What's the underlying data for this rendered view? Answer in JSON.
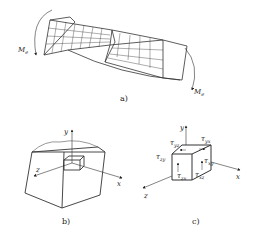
{
  "figure": {
    "panel_a": {
      "caption": "a)",
      "moment_left": {
        "symbol": "M",
        "subscript": "e"
      },
      "moment_right": {
        "symbol": "M",
        "subscript": "e"
      },
      "description": "Twisted rectangular bar with surface grid under torque"
    },
    "panel_b": {
      "caption": "b)",
      "axes": {
        "x": "x",
        "y": "y",
        "z": "z"
      },
      "description": "Cut-out block with small element at origin"
    },
    "panel_c": {
      "caption": "c)",
      "axes": {
        "x": "x",
        "y": "y",
        "z": "z"
      },
      "stresses": [
        {
          "symbol": "τ",
          "subscript": "yz"
        },
        {
          "symbol": "τ",
          "subscript": "yx"
        },
        {
          "symbol": "τ",
          "subscript": "zy"
        },
        {
          "symbol": "τ",
          "subscript": "xy"
        },
        {
          "symbol": "τ",
          "subscript": "zx"
        },
        {
          "symbol": "τ",
          "subscript": "xz"
        }
      ],
      "description": "Element with shear stress components"
    }
  }
}
